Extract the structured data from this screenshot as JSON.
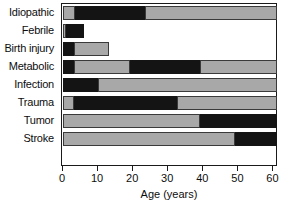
{
  "chart_data": {
    "type": "bar",
    "orientation": "horizontal",
    "stacked": true,
    "title": "",
    "xlabel": "Age (years)",
    "ylabel": "",
    "xlim": [
      0,
      61
    ],
    "grid": false,
    "legend": null,
    "xticks": [
      0,
      10,
      20,
      30,
      40,
      50,
      60
    ],
    "xtick_labels": [
      "0",
      "10",
      "20",
      "30",
      "40",
      "50",
      "60"
    ],
    "categories": [
      "Idiopathic",
      "Febrile",
      "Birth injury",
      "Metabolic",
      "Infection",
      "Trauma",
      "Tumor",
      "Stroke"
    ],
    "colors": {
      "gray": "#a8a8a8",
      "black": "#141414",
      "frame": "#1a1a1a",
      "background": "#ffffff"
    },
    "bars": [
      {
        "category": "Idiopathic",
        "start": 0,
        "end": 61,
        "segments": [
          {
            "fill": "gray",
            "start": 0,
            "end": 3.5
          },
          {
            "fill": "black",
            "start": 3.5,
            "end": 23.5
          },
          {
            "fill": "gray",
            "start": 23.5,
            "end": 61
          }
        ]
      },
      {
        "category": "Febrile",
        "start": 0,
        "end": 6,
        "segments": [
          {
            "fill": "gray",
            "start": 0,
            "end": 0.8
          },
          {
            "fill": "black",
            "start": 0.8,
            "end": 6
          }
        ]
      },
      {
        "category": "Birth injury",
        "start": 0,
        "end": 13,
        "segments": [
          {
            "fill": "black",
            "start": 0,
            "end": 3
          },
          {
            "fill": "gray",
            "start": 3,
            "end": 13
          }
        ]
      },
      {
        "category": "Metabolic",
        "start": 0,
        "end": 61,
        "segments": [
          {
            "fill": "black",
            "start": 0,
            "end": 3
          },
          {
            "fill": "gray",
            "start": 3,
            "end": 19
          },
          {
            "fill": "black",
            "start": 19,
            "end": 39
          },
          {
            "fill": "gray",
            "start": 39,
            "end": 61
          }
        ]
      },
      {
        "category": "Infection",
        "start": 0,
        "end": 61,
        "segments": [
          {
            "fill": "black",
            "start": 0,
            "end": 10
          },
          {
            "fill": "gray",
            "start": 10,
            "end": 61
          }
        ]
      },
      {
        "category": "Trauma",
        "start": 0,
        "end": 61,
        "segments": [
          {
            "fill": "gray",
            "start": 0,
            "end": 3
          },
          {
            "fill": "black",
            "start": 3,
            "end": 32.5
          },
          {
            "fill": "gray",
            "start": 32.5,
            "end": 61
          }
        ]
      },
      {
        "category": "Tumor",
        "start": 0,
        "end": 61,
        "segments": [
          {
            "fill": "gray",
            "start": 0,
            "end": 39
          },
          {
            "fill": "black",
            "start": 39,
            "end": 61
          }
        ]
      },
      {
        "category": "Stroke",
        "start": 0,
        "end": 61,
        "segments": [
          {
            "fill": "gray",
            "start": 0,
            "end": 49
          },
          {
            "fill": "black",
            "start": 49,
            "end": 61
          }
        ]
      }
    ]
  }
}
